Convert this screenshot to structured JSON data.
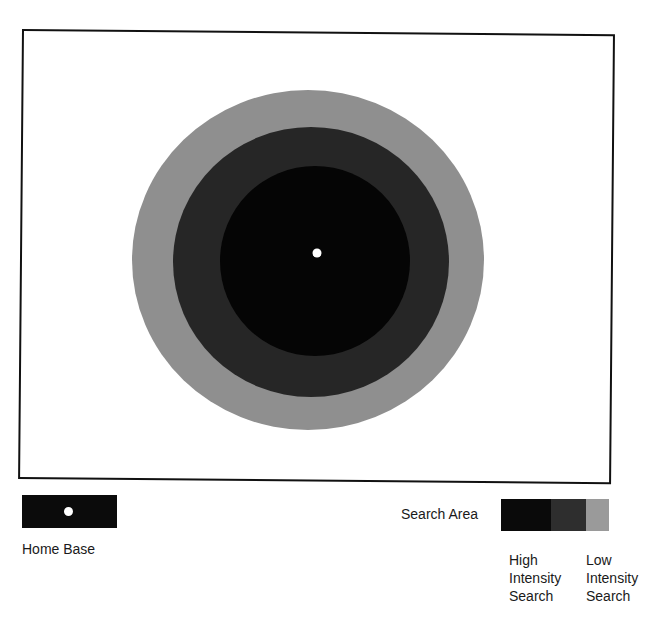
{
  "diagram": {
    "zones": [
      {
        "name": "low-intensity",
        "color": "#8f8f8f",
        "cx": 308,
        "cy": 260,
        "rx": 176,
        "ry": 170
      },
      {
        "name": "medium-intensity",
        "color": "#262626",
        "cx": 311,
        "cy": 262,
        "rx": 138,
        "ry": 135
      },
      {
        "name": "high-intensity",
        "color": "#050505",
        "cx": 315,
        "cy": 261,
        "rx": 95,
        "ry": 95
      }
    ],
    "home_base": {
      "cx": 317,
      "cy": 253,
      "r": 4.5,
      "color": "#ffffff"
    }
  },
  "legend": {
    "home_base_label": "Home Base",
    "search_area_label": "Search Area",
    "search_segments": [
      {
        "color": "#0a0a0a",
        "width": 50
      },
      {
        "color": "#2e2e2e",
        "width": 35
      },
      {
        "color": "#9a9a9a",
        "width": 23
      }
    ],
    "high_label": [
      "High",
      "Intensity",
      "Search"
    ],
    "low_label": [
      "Low",
      "Intensity",
      "Search"
    ]
  }
}
